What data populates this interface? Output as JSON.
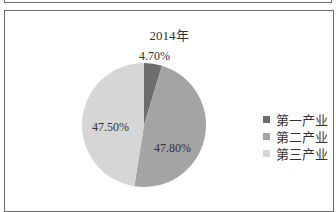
{
  "chart_data": {
    "type": "pie",
    "title": "2014年",
    "categories": [
      "第一产业",
      "第二产业",
      "第三产业"
    ],
    "values": [
      4.7,
      47.8,
      47.5
    ],
    "labels": [
      "4.70%",
      "47.80%",
      "47.50%"
    ],
    "colors": [
      "#6e6e6e",
      "#a4a4a4",
      "#d6d6d6"
    ],
    "legend_position": "right"
  }
}
